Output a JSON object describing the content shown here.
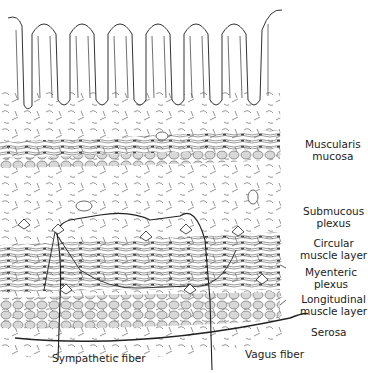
{
  "diagram": {
    "labels": {
      "muscularis_mucosa": [
        "Muscularis",
        "mucosa"
      ],
      "submucous_plexus": [
        "Submucous",
        "plexus"
      ],
      "circular_muscle": [
        "Circular",
        "muscle layer"
      ],
      "myenteric_plexus": [
        "Myenteric",
        "plexus"
      ],
      "longitudinal_muscle": [
        "Longitudinal",
        "muscle layer"
      ],
      "serosa": "Serosa",
      "sympathetic_fiber": "Sympathetic fiber",
      "vagus_fiber": "Vagus fiber"
    },
    "villi_count": 7,
    "colors": {
      "ink": "#2a2a2a",
      "cell_fill": "#d8d8d8",
      "background": "#ffffff"
    }
  }
}
